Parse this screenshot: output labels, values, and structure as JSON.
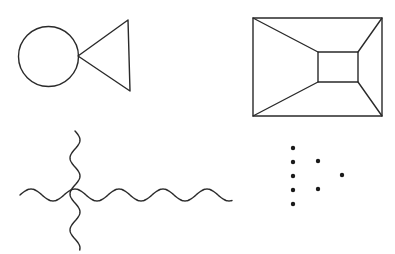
{
  "figure": {
    "background": "#ffffff",
    "stroke_color": "#2a2a2a",
    "panels": [
      {
        "name": "circle-triangle",
        "shapes": {
          "circle": {
            "cx": 48.5,
            "cy": 56.5,
            "r": 30
          },
          "triangle": {
            "points": "78,56 128,20 130,91"
          }
        }
      },
      {
        "name": "perspective-rectangle",
        "shapes": {
          "outer": {
            "x": 253,
            "y": 18,
            "w": 129,
            "h": 98
          },
          "inner": {
            "x": 318,
            "y": 52,
            "w": 40,
            "h": 30
          },
          "connectors": [
            [
              253,
              18,
              318,
              52
            ],
            [
              382,
              18,
              358,
              52
            ],
            [
              253,
              116,
              318,
              82
            ],
            [
              382,
              116,
              358,
              82
            ]
          ]
        }
      },
      {
        "name": "wavy-cross",
        "shapes": {
          "horizontal_wave": {
            "x_start": 20,
            "x_end": 232,
            "y": 195,
            "amplitude": 6,
            "wavelength": 44
          },
          "vertical_wave": {
            "x": 75,
            "y_start": 131,
            "y_end": 250,
            "amplitude": 5,
            "wavelength": 36
          }
        }
      },
      {
        "name": "dot-pattern",
        "shapes": {
          "dots": [
            {
              "x": 293,
              "y": 148
            },
            {
              "x": 293,
              "y": 162
            },
            {
              "x": 293,
              "y": 176
            },
            {
              "x": 293,
              "y": 190
            },
            {
              "x": 293,
              "y": 204
            },
            {
              "x": 318,
              "y": 161
            },
            {
              "x": 318,
              "y": 189
            },
            {
              "x": 342,
              "y": 175
            }
          ],
          "radius": 2.2
        }
      }
    ]
  }
}
